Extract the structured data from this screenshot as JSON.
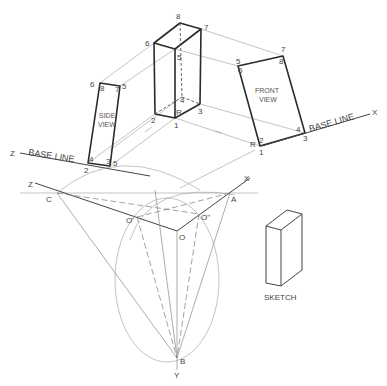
{
  "box_labels": {
    "p8": "8",
    "p7": "7",
    "p6": "6",
    "p5": "5",
    "p4": "4",
    "p3": "3",
    "p2": "2",
    "p1": "1",
    "pR": "R"
  },
  "side_view": {
    "title_line1": "SIDE",
    "title_line2": "VIEW",
    "labels": {
      "tl_a": "6",
      "tl_b": "8",
      "tr": "7",
      "tr2": "5",
      "bl_a": "4",
      "bl_b": "2",
      "br_a": "3",
      "br_b": "5"
    }
  },
  "front_view": {
    "title_line1": "FRONT",
    "title_line2": "VIEW",
    "labels": {
      "tl_a": "5",
      "tl_b": "6",
      "tr_a": "7",
      "tr_b": "8",
      "br_a": "4",
      "br_b": "3",
      "bl_a": "R",
      "bl_b": "2",
      "bl_c": "1"
    }
  },
  "base_lines": {
    "left": {
      "axis": "Z",
      "text": "BASE LINE"
    },
    "right": {
      "axis": "X",
      "text": "BASE LINE"
    }
  },
  "construction": {
    "z_axis": "Z",
    "x_axis": "X",
    "y_axis": "Y",
    "point_c": "C",
    "point_a": "A",
    "point_b": "B",
    "point_o": "O",
    "point_o1": "O'",
    "point_o2": "O\""
  },
  "sketch": {
    "caption": "SKETCH"
  }
}
